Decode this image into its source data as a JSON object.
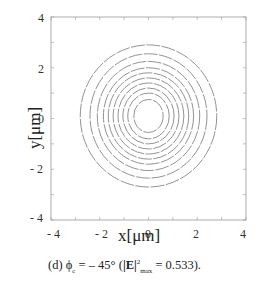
{
  "chart_data": {
    "type": "contour",
    "title": "",
    "caption": {
      "prefix": "(d) ",
      "phi": "ϕ",
      "phi_sub": "c",
      "equals": " = – 45° (",
      "E_label": "|E|",
      "E_sup": "2",
      "E_sub": "max",
      "suffix": " = 0.533)."
    },
    "xlabel": "x[μm]",
    "ylabel": "y[μm]",
    "xlim": [
      -4,
      4
    ],
    "ylim": [
      -4,
      4
    ],
    "x_ticks": [
      "- 4",
      "- 2",
      "0",
      "2",
      "4"
    ],
    "y_ticks": [
      "4",
      "2",
      "0",
      "- 2",
      "- 4"
    ],
    "grid": false,
    "contour_center": [
      0,
      0.1
    ],
    "contour_count": 10,
    "contour_radii_x_um": [
      0.6,
      0.85,
      1.05,
      1.25,
      1.45,
      1.65,
      1.85,
      2.1,
      2.4,
      2.8
    ],
    "contour_radii_y_um": [
      0.65,
      0.9,
      1.1,
      1.3,
      1.5,
      1.7,
      1.9,
      2.15,
      2.45,
      2.8
    ],
    "max_intensity": 0.533
  }
}
